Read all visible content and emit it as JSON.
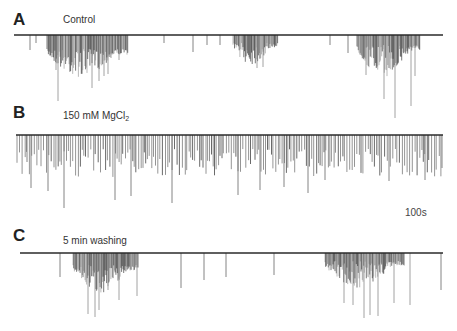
{
  "chart_data": {
    "type": "line",
    "title": "",
    "scale_bar": {
      "label": "100s"
    },
    "colors": {
      "trace": "#2a2a2a",
      "spike_light": "#8a8a8a",
      "spike_dark": "#1e1e1e",
      "background": "#ffffff"
    },
    "panels": [
      {
        "letter": "A",
        "label": "Control",
        "baseline_y": 35,
        "x_range": [
          14,
          443
        ],
        "isolated_spikes": [
          [
            30,
            50
          ],
          [
            36,
            43
          ],
          [
            164,
            43
          ],
          [
            193,
            52
          ],
          [
            207,
            45
          ],
          [
            220,
            45
          ],
          [
            330,
            45
          ],
          [
            348,
            53
          ]
        ],
        "bursts": [
          {
            "x_start": 47,
            "x_end": 128,
            "density": 1.4,
            "depth_min": 14,
            "depth_max": 42,
            "peak_spikes": [
              [
                56,
                70
              ],
              [
                58,
                101
              ],
              [
                92,
                88
              ],
              [
                99,
                81
              ],
              [
                104,
                76
              ],
              [
                108,
                74
              ],
              [
                111,
                58
              ],
              [
                119,
                60
              ]
            ]
          },
          {
            "x_start": 233,
            "x_end": 278,
            "density": 1.3,
            "depth_min": 8,
            "depth_max": 30,
            "peak_spikes": [
              [
                257,
                68
              ],
              [
                263,
                67
              ]
            ]
          },
          {
            "x_start": 357,
            "x_end": 420,
            "density": 1.5,
            "depth_min": 10,
            "depth_max": 42,
            "peak_spikes": [
              [
                366,
                75
              ],
              [
                384,
                99
              ],
              [
                395,
                118
              ],
              [
                411,
                106
              ],
              [
                415,
                76
              ]
            ]
          }
        ]
      },
      {
        "letter": "B",
        "label_main": "150 mM MgCl",
        "label_sub": "2",
        "baseline_y": 135,
        "x_range": [
          16,
          443
        ],
        "continuous": {
          "x_start": 17,
          "x_end": 442,
          "spacing": 2.2,
          "depth_min": 14,
          "depth_max": 42
        },
        "isolated_spikes": [
          [
            27,
            162
          ],
          [
            31,
            188
          ],
          [
            48,
            191
          ],
          [
            64,
            208
          ],
          [
            115,
            200
          ],
          [
            131,
            196
          ],
          [
            172,
            203
          ],
          [
            238,
            195
          ],
          [
            260,
            190
          ],
          [
            284,
            187
          ],
          [
            308,
            193
          ],
          [
            325,
            180
          ],
          [
            389,
            181
          ],
          [
            425,
            180
          ],
          [
            442,
            168
          ]
        ]
      },
      {
        "letter": "C",
        "label": "5 min washing",
        "baseline_y": 253,
        "x_range": [
          20,
          443
        ],
        "isolated_spikes": [
          [
            60,
            277
          ],
          [
            181,
            288
          ],
          [
            204,
            280
          ],
          [
            226,
            277
          ],
          [
            274,
            275
          ],
          [
            441,
            290
          ]
        ],
        "bursts": [
          {
            "x_start": 73,
            "x_end": 138,
            "density": 1.4,
            "depth_min": 12,
            "depth_max": 40,
            "peak_spikes": [
              [
                88,
                314
              ],
              [
                95,
                317
              ],
              [
                99,
                310
              ],
              [
                108,
                290
              ],
              [
                119,
                300
              ],
              [
                137,
                296
              ]
            ]
          },
          {
            "x_start": 325,
            "x_end": 405,
            "density": 1.5,
            "depth_min": 8,
            "depth_max": 35,
            "peak_spikes": [
              [
                344,
                303
              ],
              [
                353,
                305
              ],
              [
                364,
                318
              ],
              [
                370,
                315
              ],
              [
                378,
                316
              ],
              [
                394,
                303
              ],
              [
                410,
                305
              ]
            ]
          }
        ]
      }
    ]
  },
  "figure": {
    "panel_a": {
      "letter": "A",
      "label": "Control"
    },
    "panel_b": {
      "letter": "B",
      "label_main": "150 mM MgCl",
      "label_sub": "2"
    },
    "panel_c": {
      "letter": "C",
      "label": "5 min washing"
    },
    "scale_bar_label": "100s"
  }
}
